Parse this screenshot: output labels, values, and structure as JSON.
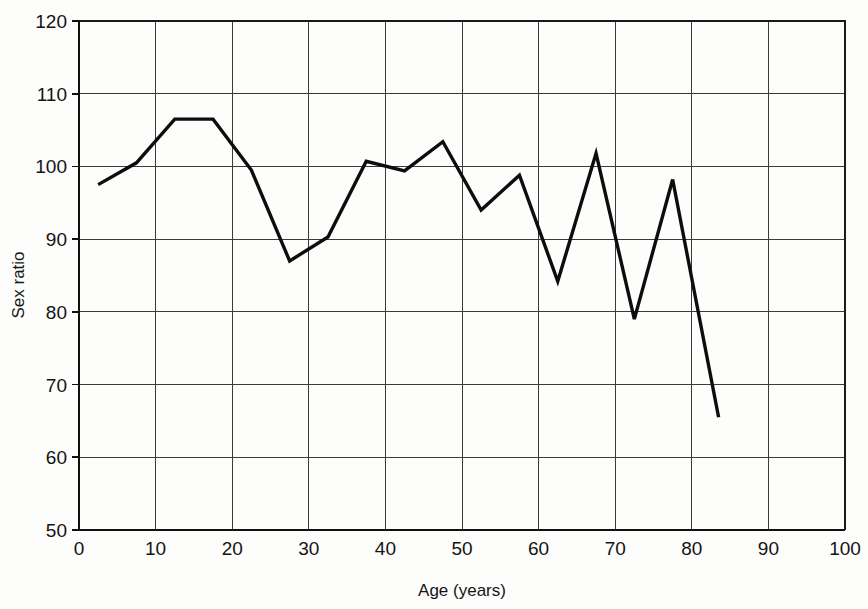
{
  "chart_data": {
    "type": "line",
    "title": "",
    "xlabel": "Age (years)",
    "ylabel": "Sex ratio",
    "xlim": [
      0,
      100
    ],
    "ylim": [
      50,
      120
    ],
    "xticks": [
      0,
      10,
      20,
      30,
      40,
      50,
      60,
      70,
      80,
      90,
      100
    ],
    "yticks": [
      50,
      60,
      70,
      80,
      90,
      100,
      110,
      120
    ],
    "xtick_labels": [
      "0",
      "10",
      "20",
      "30",
      "40",
      "50",
      "60",
      "70",
      "80",
      "90",
      "100"
    ],
    "ytick_labels": [
      "50",
      "60",
      "70",
      "80",
      "90",
      "100",
      "110",
      "120"
    ],
    "grid": true,
    "grid_color": "#3a3a3a",
    "legend": false,
    "legend_position": "none",
    "line_color": "#0d0d0d",
    "series": [
      {
        "name": "Sex ratio by age",
        "x": [
          2.5,
          7.5,
          12.5,
          17.5,
          22.5,
          27.5,
          32.5,
          37.5,
          42.5,
          47.5,
          52.5,
          57.5,
          62.5,
          67.5,
          72.5,
          77.5,
          83.5
        ],
        "values": [
          97.5,
          100.5,
          106.5,
          106.5,
          99.5,
          87.0,
          90.3,
          100.7,
          99.4,
          103.4,
          94.0,
          98.8,
          84.2,
          101.8,
          79.0,
          98.2,
          65.5
        ]
      }
    ]
  },
  "axes": {
    "x_axis_title": "Age (years)",
    "y_axis_title": "Sex ratio"
  }
}
